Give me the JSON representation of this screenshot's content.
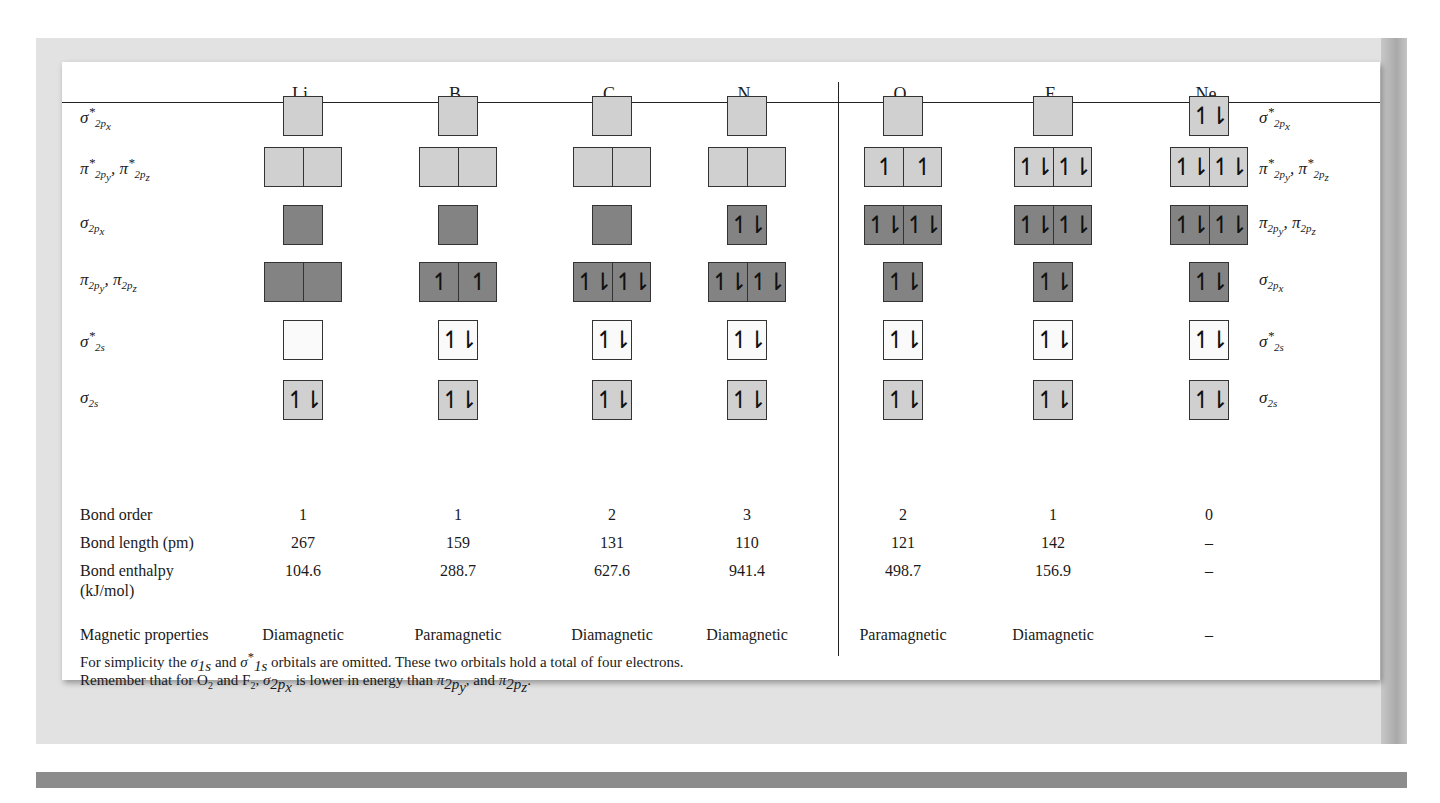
{
  "table": {
    "molecules": [
      {
        "symbol": "Li",
        "subscript": "2"
      },
      {
        "symbol": "B",
        "subscript": "2"
      },
      {
        "symbol": "C",
        "subscript": "2"
      },
      {
        "symbol": "N",
        "subscript": "2"
      },
      {
        "symbol": "O",
        "subscript": "2"
      },
      {
        "symbol": "F",
        "subscript": "2"
      },
      {
        "symbol": "Ne",
        "subscript": "2"
      }
    ],
    "left_orbital_labels": [
      {
        "base": "σ",
        "sup": "*",
        "sub": "2p",
        "subsub": "x"
      },
      {
        "base": "π",
        "sup": "*",
        "sub": "2p",
        "subsub": "y",
        "base2": "π",
        "sup2": "*",
        "sub2": "2p",
        "subsub2": "z"
      },
      {
        "base": "σ",
        "sup": "",
        "sub": "2p",
        "subsub": "x"
      },
      {
        "base": "π",
        "sup": "",
        "sub": "2p",
        "subsub": "y",
        "base2": "π",
        "sup2": "",
        "sub2": "2p",
        "subsub2": "z"
      },
      {
        "base": "σ",
        "sup": "*",
        "sub": "2s",
        "subsub": ""
      },
      {
        "base": "σ",
        "sup": "",
        "sub": "2s",
        "subsub": ""
      }
    ],
    "right_orbital_labels": [
      {
        "base": "σ",
        "sup": "*",
        "sub": "2p",
        "subsub": "x"
      },
      {
        "base": "π",
        "sup": "*",
        "sub": "2p",
        "subsub": "y",
        "base2": "π",
        "sup2": "*",
        "sub2": "2p",
        "subsub2": "z"
      },
      {
        "base": "π",
        "sup": "",
        "sub": "2p",
        "subsub": "y",
        "base2": "π",
        "sup2": "",
        "sub2": "2p",
        "subsub2": "z"
      },
      {
        "base": "σ",
        "sup": "",
        "sub": "2p",
        "subsub": "x"
      },
      {
        "base": "σ",
        "sup": "*",
        "sub": "2s",
        "subsub": ""
      },
      {
        "base": "σ",
        "sup": "",
        "sub": "2s",
        "subsub": ""
      }
    ],
    "orbital_rows": [
      {
        "type": "single",
        "fill": "light",
        "cells": [
          [
            ""
          ],
          [
            ""
          ],
          [
            ""
          ],
          [
            ""
          ],
          [
            ""
          ],
          [
            ""
          ],
          [
            "↿⇂"
          ]
        ]
      },
      {
        "type": "double",
        "fill": "light",
        "cells": [
          [
            "",
            ""
          ],
          [
            "",
            ""
          ],
          [
            "",
            ""
          ],
          [
            "",
            ""
          ],
          [
            "↿",
            "↿"
          ],
          [
            "↿⇂",
            "↿⇂"
          ],
          [
            "↿⇂",
            "↿⇂"
          ]
        ]
      },
      {
        "type": "mixed",
        "fill": "dark",
        "cells": [
          [
            ""
          ],
          [
            ""
          ],
          [
            ""
          ],
          [
            "↿⇂"
          ],
          [
            "↿⇂",
            "↿⇂"
          ],
          [
            "↿⇂",
            "↿⇂"
          ],
          [
            "↿⇂",
            "↿⇂"
          ]
        ]
      },
      {
        "type": "mixed",
        "fill": "dark",
        "cells": [
          [
            "",
            ""
          ],
          [
            "↿",
            "↿"
          ],
          [
            "↿⇂",
            "↿⇂"
          ],
          [
            "↿⇂",
            "↿⇂"
          ],
          [
            "↿⇂"
          ],
          [
            "↿⇂"
          ],
          [
            "↿⇂"
          ]
        ]
      },
      {
        "type": "single",
        "fill": "white",
        "cells": [
          [
            ""
          ],
          [
            "↿⇂"
          ],
          [
            "↿⇂"
          ],
          [
            "↿⇂"
          ],
          [
            "↿⇂"
          ],
          [
            "↿⇂"
          ],
          [
            "↿⇂"
          ]
        ]
      },
      {
        "type": "single",
        "fill": "light",
        "cells": [
          [
            "↿⇂"
          ],
          [
            "↿⇂"
          ],
          [
            "↿⇂"
          ],
          [
            "↿⇂"
          ],
          [
            "↿⇂"
          ],
          [
            "↿⇂"
          ],
          [
            "↿⇂"
          ]
        ]
      }
    ],
    "property_rows": [
      {
        "label": "Bond order",
        "values": [
          "1",
          "1",
          "2",
          "3",
          "2",
          "1",
          "0"
        ]
      },
      {
        "label": "Bond length (pm)",
        "values": [
          "267",
          "159",
          "131",
          "110",
          "121",
          "142",
          "–"
        ]
      },
      {
        "label": "Bond enthalpy",
        "label2": "(kJ/mol)",
        "values": [
          "104.6",
          "288.7",
          "627.6",
          "941.4",
          "498.7",
          "156.9",
          "–"
        ]
      },
      {
        "label": "Magnetic properties",
        "values": [
          "Diamagnetic",
          "Paramagnetic",
          "Diamagnetic",
          "Diamagnetic",
          "Paramagnetic",
          "Diamagnetic",
          "–"
        ]
      }
    ]
  },
  "notes": {
    "line1": {
      "t1": "For simplicity the ",
      "s1_base": "σ",
      "s1_sub": "1s",
      "t2": " and ",
      "s2_base": "σ",
      "s2_sup": "*",
      "s2_sub": "1s",
      "t3": " orbitals are omitted.  These two orbitals hold a total of four electrons."
    },
    "line2": {
      "t1": "Remember that for O",
      "o_sub": "2",
      "t2": " and F",
      "f_sub": "2",
      "t3": ", ",
      "s_base": "σ",
      "s_sub": "2p",
      "s_subsub": "x",
      "t4": " is lower in energy than ",
      "p1_base": "π",
      "p1_sub": "2p",
      "p1_subsub": "y",
      "t5": ", and ",
      "p2_base": "π",
      "p2_sub": "2p",
      "p2_subsub": "z",
      "t6": "."
    }
  },
  "colors": {
    "antibonding_fill": "#d0d0d0",
    "bonding_fill": "#838383",
    "sigma2s_star_fill": "#fafafa",
    "frame": "#e2e2e2",
    "bottom_band": "#8c8c8c"
  }
}
